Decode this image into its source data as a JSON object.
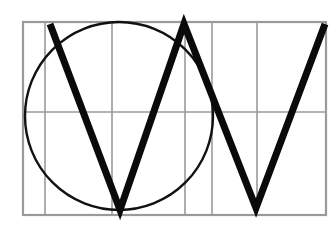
{
  "figure": {
    "background_color": "#ffffff",
    "width": 331,
    "height": 237
  },
  "colors": {
    "grid": "#9a9a9a",
    "circle": "#111111",
    "zigzag": "#0a0a0a",
    "background": "#ffffff"
  },
  "chart_data": {
    "type": "scatter",
    "xlabel": "",
    "ylabel": "",
    "grid": true,
    "legend": "none",
    "xlim": [
      23,
      326
    ],
    "ylim": [
      22,
      215
    ],
    "grid_rect": {
      "x": 23,
      "y": 22,
      "width": 303,
      "height": 193
    },
    "vertical_gridlines": [
      23,
      45,
      112,
      185,
      212,
      257,
      326
    ],
    "horizontal_gridlines": [
      22,
      112,
      215
    ],
    "shapes": [
      {
        "name": "circle",
        "type": "circle",
        "cx": 119,
        "cy": 116,
        "r": 94,
        "stroke": "#111111",
        "stroke_width": 2.4,
        "fill": "none"
      },
      {
        "name": "zigzag-vv",
        "type": "polyline",
        "points": [
          [
            50,
            24
          ],
          [
            120,
            210
          ],
          [
            184,
            24
          ],
          [
            256,
            208
          ],
          [
            325,
            24
          ]
        ],
        "stroke": "#0a0a0a",
        "stroke_width": 7,
        "fill": "none"
      }
    ]
  }
}
